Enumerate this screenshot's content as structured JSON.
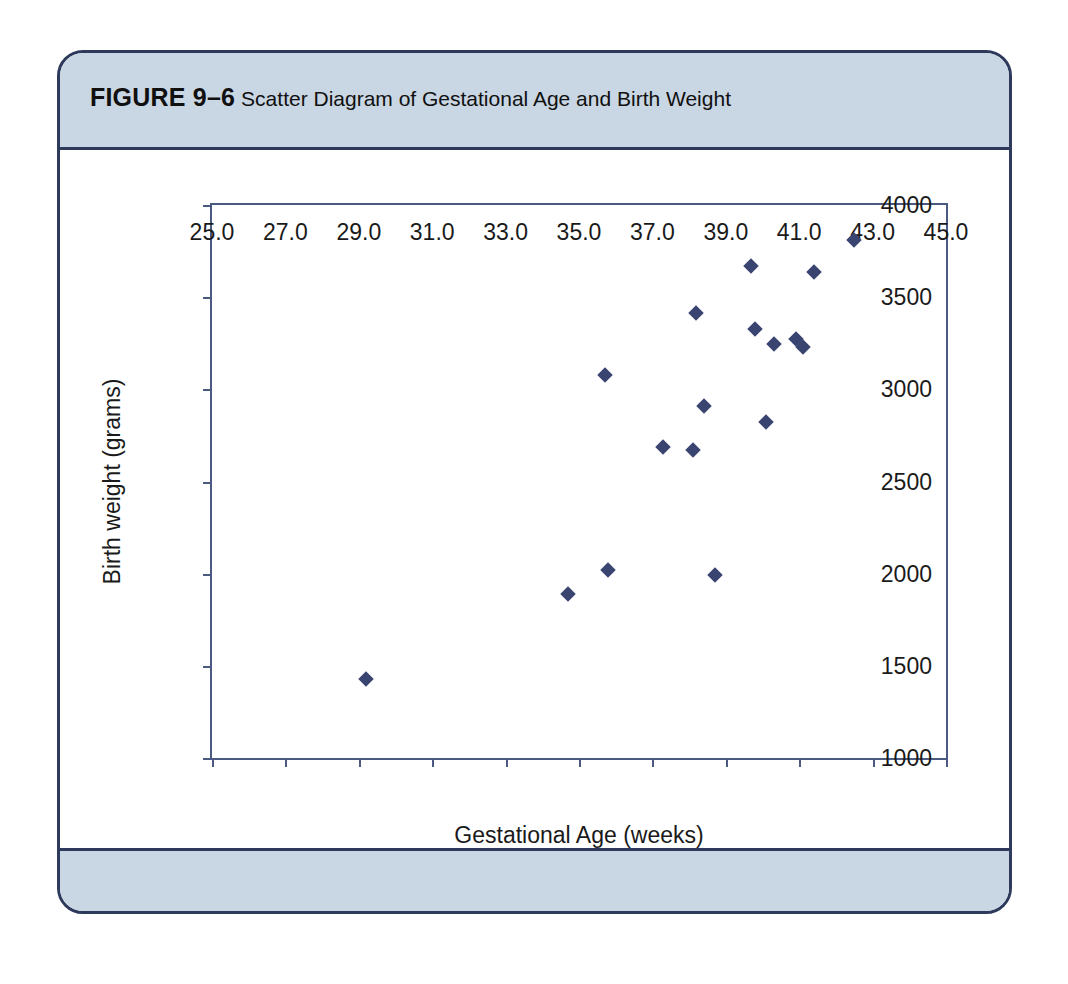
{
  "figure": {
    "label": "FIGURE 9–6",
    "title": "Scatter Diagram of Gestational Age and Birth Weight"
  },
  "colors": {
    "border": "#2d3a5c",
    "band": "#c9d6e3",
    "axis": "#4a5a80",
    "marker": "#3a4470",
    "plot_background": "#ffffff"
  },
  "chart_data": {
    "type": "scatter",
    "title": "Scatter Diagram of Gestational Age and Birth Weight",
    "xlabel": "Gestational Age (weeks)",
    "ylabel": "Birth weight (grams)",
    "xlim": [
      25.0,
      45.0
    ],
    "ylim": [
      1000,
      4000
    ],
    "xticks": [
      25.0,
      27.0,
      29.0,
      31.0,
      33.0,
      35.0,
      37.0,
      39.0,
      41.0,
      43.0,
      45.0
    ],
    "xtick_labels": [
      "25.0",
      "27.0",
      "29.0",
      "31.0",
      "33.0",
      "35.0",
      "37.0",
      "39.0",
      "41.0",
      "43.0",
      "45.0"
    ],
    "yticks": [
      1000,
      1500,
      2000,
      2500,
      3000,
      3500,
      4000
    ],
    "ytick_labels": [
      "1000",
      "1500",
      "2000",
      "2500",
      "3000",
      "3500",
      "4000"
    ],
    "grid": false,
    "legend": false,
    "marker": "diamond",
    "points": [
      {
        "x": 29.2,
        "y": 1428
      },
      {
        "x": 34.7,
        "y": 1888
      },
      {
        "x": 35.8,
        "y": 2022
      },
      {
        "x": 38.7,
        "y": 1995
      },
      {
        "x": 37.3,
        "y": 2688
      },
      {
        "x": 38.1,
        "y": 2670
      },
      {
        "x": 40.1,
        "y": 2822
      },
      {
        "x": 38.4,
        "y": 2910
      },
      {
        "x": 35.7,
        "y": 3078
      },
      {
        "x": 38.2,
        "y": 3415
      },
      {
        "x": 39.7,
        "y": 3670
      },
      {
        "x": 39.8,
        "y": 3325
      },
      {
        "x": 40.3,
        "y": 3245
      },
      {
        "x": 40.9,
        "y": 3272
      },
      {
        "x": 41.1,
        "y": 3232
      },
      {
        "x": 41.4,
        "y": 3637
      },
      {
        "x": 42.5,
        "y": 3808
      }
    ]
  }
}
